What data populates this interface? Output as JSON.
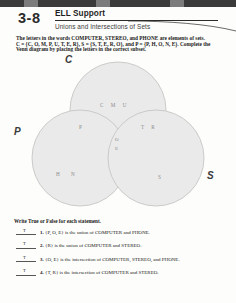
{
  "worksheet": {
    "lesson_number": "3-8",
    "title": "ELL Support",
    "subtitle": "Unions and Intersections of Sets",
    "intro_lines": [
      "The letters in the words COMPUTER, STEREO, and PHONE are elements of sets.",
      "C = {C, O, M, P, U, T, E, R}, S = {S, T, E, R, O}, and P = {P, H, O, N, E}. Complete the",
      "Venn diagram by placing the letters in the correct subset."
    ]
  },
  "venn": {
    "labels": {
      "c": "C",
      "p": "P",
      "s": "S"
    },
    "regions": {
      "c_only": "C  M  U",
      "c_and_p": "P",
      "c_and_s": "T  R",
      "center": "O",
      "center_lower": "E",
      "p_only": "H  N",
      "s_only": "S"
    },
    "colors": {
      "circle_fill": "#e8e8e8",
      "circle_stroke": "#a8a8a8",
      "letter_color": "#7a7a7a"
    }
  },
  "true_false": {
    "heading": "Write True or False for each statement.",
    "items": [
      {
        "answer": "T",
        "number": "1.",
        "statement": "{P, O, E} is the union of COMPUTER and PHONE."
      },
      {
        "answer": "T",
        "number": "2.",
        "statement": "{R} is the union of COMPUTER and STEREO."
      },
      {
        "answer": "T",
        "number": "3.",
        "statement": "{O, E} is the intersection of COMPUTER, STEREO, and PHONE."
      },
      {
        "answer": "T",
        "number": "4.",
        "statement": "{T, R} is the intersection of COMPUTER and STEREO."
      }
    ]
  }
}
